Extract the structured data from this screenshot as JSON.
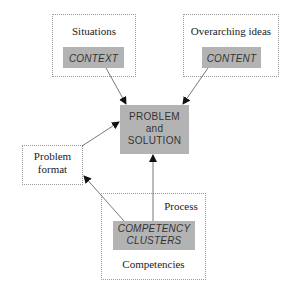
{
  "diagram": {
    "nodes": {
      "situations": {
        "outer_label": "Situations",
        "inner_label": "CONTEXT"
      },
      "overarching": {
        "outer_label": "Overarching ideas",
        "inner_label": "CONTENT"
      },
      "center": {
        "line1": "PROBLEM",
        "line2": "and",
        "line3": "SOLUTION"
      },
      "problem_format": {
        "line1": "Problem",
        "line2": "format"
      },
      "competencies": {
        "top_label": "Process",
        "inner_line1": "COMPETENCY",
        "inner_line2": "CLUSTERS",
        "bottom_label": "Competencies"
      }
    },
    "edges": [
      {
        "from": "CONTEXT",
        "to": "PROBLEM and SOLUTION"
      },
      {
        "from": "CONTENT",
        "to": "PROBLEM and SOLUTION"
      },
      {
        "from": "Problem format",
        "to": "PROBLEM and SOLUTION"
      },
      {
        "from": "COMPETENCY CLUSTERS",
        "to": "Problem format"
      },
      {
        "from": "COMPETENCY CLUSTERS",
        "to": "PROBLEM and SOLUTION",
        "label": "Process"
      }
    ],
    "colors": {
      "box_fill": "#b3b3b3",
      "dotted_border": "#9a9a9a",
      "arrow": "#555555"
    }
  }
}
